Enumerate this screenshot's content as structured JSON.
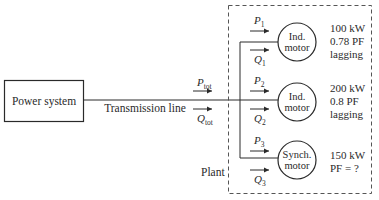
{
  "source": {
    "label": "Power system"
  },
  "line": {
    "label": "Transmission line",
    "p_symbol": "P",
    "p_sub": "tot",
    "q_symbol": "Q",
    "q_sub": "tot"
  },
  "plant": {
    "label": "Plant"
  },
  "loads": [
    {
      "p_symbol": "P",
      "p_sub": "1",
      "q_symbol": "Q",
      "q_sub": "1",
      "motor_line1": "Ind.",
      "motor_line2": "motor",
      "spec1": "100 kW",
      "spec2": "0.78 PF",
      "spec3": "lagging"
    },
    {
      "p_symbol": "P",
      "p_sub": "2",
      "q_symbol": "Q",
      "q_sub": "2",
      "motor_line1": "Ind.",
      "motor_line2": "motor",
      "spec1": "200 kW",
      "spec2": "0.8 PF",
      "spec3": "lagging"
    },
    {
      "p_symbol": "P",
      "p_sub": "3",
      "q_symbol": "Q",
      "q_sub": "3",
      "motor_line1": "Synch.",
      "motor_line2": "motor",
      "spec1": "150 kW",
      "spec2": "PF = ?",
      "spec3": ""
    }
  ]
}
